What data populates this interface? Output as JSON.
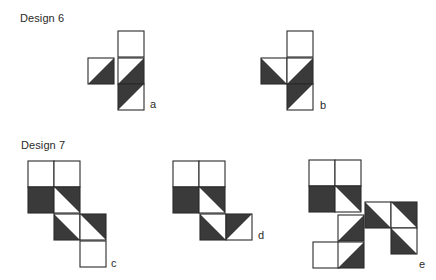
{
  "colors": {
    "dark": "#3a3a3a",
    "line": "#2b2b2b",
    "background": "#ffffff"
  },
  "legend_note": "shade codes: none=white, full=solid dark, ul/ur/ll/lr = dark triangle in upper-left/upper-right/lower-left/lower-right corner",
  "sections": [
    {
      "heading": "Design 6",
      "heading_pos": {
        "x": 20,
        "y": 13
      },
      "figures": [
        {
          "label": "a",
          "label_pos": {
            "x": 150,
            "y": 99
          },
          "size": 26,
          "cells": [
            {
              "x": 118,
              "y": 31,
              "shade": "none"
            },
            {
              "x": 88,
              "y": 58,
              "shade": "lr"
            },
            {
              "x": 118,
              "y": 58,
              "shade": "lr"
            },
            {
              "x": 118,
              "y": 84,
              "shade": "ul"
            }
          ]
        },
        {
          "label": "b",
          "label_pos": {
            "x": 320,
            "y": 100
          },
          "size": 26,
          "cells": [
            {
              "x": 287,
              "y": 31,
              "shade": "none"
            },
            {
              "x": 261,
              "y": 58,
              "shade": "ll"
            },
            {
              "x": 287,
              "y": 58,
              "shade": "lr"
            },
            {
              "x": 287,
              "y": 84,
              "shade": "ul"
            }
          ]
        }
      ]
    },
    {
      "heading": "Design 7",
      "heading_pos": {
        "x": 21,
        "y": 140
      },
      "figures": [
        {
          "label": "c",
          "label_pos": {
            "x": 111,
            "y": 258
          },
          "size": 26,
          "cells": [
            {
              "x": 28,
              "y": 161,
              "shade": "none"
            },
            {
              "x": 54,
              "y": 161,
              "shade": "none"
            },
            {
              "x": 28,
              "y": 187,
              "shade": "full"
            },
            {
              "x": 54,
              "y": 187,
              "shade": "ur"
            },
            {
              "x": 54,
              "y": 214,
              "shade": "ll"
            },
            {
              "x": 80,
              "y": 214,
              "shade": "ur"
            },
            {
              "x": 80,
              "y": 241,
              "shade": "none"
            }
          ]
        },
        {
          "label": "d",
          "label_pos": {
            "x": 258,
            "y": 230
          },
          "size": 26,
          "cells": [
            {
              "x": 173,
              "y": 161,
              "shade": "none"
            },
            {
              "x": 199,
              "y": 161,
              "shade": "none"
            },
            {
              "x": 173,
              "y": 187,
              "shade": "full"
            },
            {
              "x": 199,
              "y": 187,
              "shade": "ur"
            },
            {
              "x": 200,
              "y": 214,
              "shade": "ll"
            },
            {
              "x": 226,
              "y": 214,
              "shade": "ul"
            }
          ]
        },
        {
          "label": "e",
          "label_pos": {
            "x": 419,
            "y": 259
          },
          "size": 26,
          "cells": [
            {
              "x": 309,
              "y": 160,
              "shade": "none"
            },
            {
              "x": 335,
              "y": 160,
              "shade": "none"
            },
            {
              "x": 309,
              "y": 186,
              "shade": "full"
            },
            {
              "x": 335,
              "y": 186,
              "shade": "ur"
            },
            {
              "x": 365,
              "y": 202,
              "shade": "ll"
            },
            {
              "x": 391,
              "y": 202,
              "shade": "ur"
            },
            {
              "x": 338,
              "y": 215,
              "shade": "lr"
            },
            {
              "x": 391,
              "y": 228,
              "shade": "ll"
            },
            {
              "x": 313,
              "y": 242,
              "shade": "none"
            },
            {
              "x": 338,
              "y": 242,
              "shade": "lr"
            }
          ]
        }
      ]
    }
  ]
}
